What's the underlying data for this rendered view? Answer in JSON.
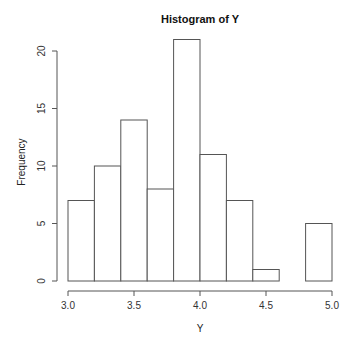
{
  "chart_data": {
    "type": "bar",
    "subtype": "histogram",
    "title": "Histogram of Y",
    "xlabel": "Y",
    "ylabel": "Frequency",
    "bins": [
      {
        "start": 3.0,
        "end": 3.2,
        "count": 7
      },
      {
        "start": 3.2,
        "end": 3.4,
        "count": 10
      },
      {
        "start": 3.4,
        "end": 3.6,
        "count": 14
      },
      {
        "start": 3.6,
        "end": 3.8,
        "count": 8
      },
      {
        "start": 3.8,
        "end": 4.0,
        "count": 21
      },
      {
        "start": 4.0,
        "end": 4.2,
        "count": 11
      },
      {
        "start": 4.2,
        "end": 4.4,
        "count": 7
      },
      {
        "start": 4.4,
        "end": 4.6,
        "count": 1
      },
      {
        "start": 4.6,
        "end": 4.8,
        "count": 0
      },
      {
        "start": 4.8,
        "end": 5.0,
        "count": 5
      }
    ],
    "categories": [
      "3.0-3.2",
      "3.2-3.4",
      "3.4-3.6",
      "3.6-3.8",
      "3.8-4.0",
      "4.0-4.2",
      "4.2-4.4",
      "4.4-4.6",
      "4.6-4.8",
      "4.8-5.0"
    ],
    "values": [
      7,
      10,
      14,
      8,
      21,
      11,
      7,
      1,
      0,
      5
    ],
    "xlim": [
      3.0,
      5.0
    ],
    "ylim": [
      0,
      21
    ],
    "x_ticks": [
      3.0,
      3.5,
      4.0,
      4.5,
      5.0
    ],
    "x_tick_labels": [
      "3.0",
      "3.5",
      "4.0",
      "4.5",
      "5.0"
    ],
    "y_ticks": [
      0,
      5,
      10,
      15,
      20
    ],
    "y_tick_labels": [
      "0",
      "5",
      "10",
      "15",
      "20"
    ],
    "grid": false,
    "legend": null
  },
  "colors": {
    "bar_fill": "#ffffff",
    "bar_stroke": "#555555",
    "axis": "#555555",
    "background": "#ffffff"
  }
}
